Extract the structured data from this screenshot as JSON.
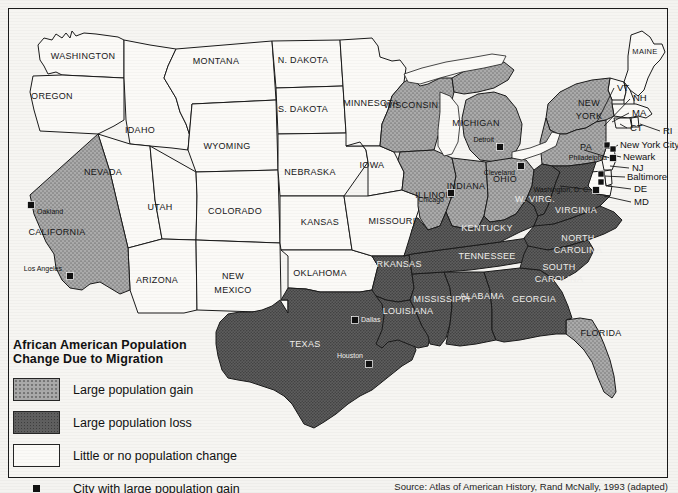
{
  "legend": {
    "title_line1": "African American Population",
    "title_line2": "Change Due to Migration",
    "items": [
      {
        "key": "gain",
        "label": "Large population gain",
        "color": "#a9a9a9"
      },
      {
        "key": "loss",
        "label": "Large population loss",
        "color": "#5f5f5f"
      },
      {
        "key": "none",
        "label": "Little or no population change",
        "color": "#fbfaf7"
      },
      {
        "key": "city",
        "label": "City with large population gain",
        "color": "#111111"
      }
    ]
  },
  "source": "Source: Atlas of American History, Rand McNally, 1993 (adapted)",
  "map": {
    "states": [
      {
        "name": "WASHINGTON",
        "class": "none",
        "lx": 83,
        "ly": 57,
        "size": ""
      },
      {
        "name": "OREGON",
        "class": "none",
        "lx": 52,
        "ly": 97,
        "size": ""
      },
      {
        "name": "IDAHO",
        "class": "none",
        "lx": 140,
        "ly": 131,
        "size": ""
      },
      {
        "name": "MONTANA",
        "class": "none",
        "lx": 216,
        "ly": 62,
        "size": ""
      },
      {
        "name": "WYOMING",
        "class": "none",
        "lx": 227,
        "ly": 147,
        "size": ""
      },
      {
        "name": "NEVADA",
        "class": "none",
        "lx": 103,
        "ly": 173,
        "size": ""
      },
      {
        "name": "UTAH",
        "class": "none",
        "lx": 160,
        "ly": 208,
        "size": ""
      },
      {
        "name": "COLORADO",
        "class": "none",
        "lx": 235,
        "ly": 212,
        "size": ""
      },
      {
        "name": "ARIZONA",
        "class": "none",
        "lx": 157,
        "ly": 281,
        "size": ""
      },
      {
        "name": "NEW",
        "class": "none",
        "lx": 233,
        "ly": 277,
        "size": ""
      },
      {
        "name": "MEXICO",
        "class": "none",
        "lx": 233,
        "ly": 291,
        "size": ""
      },
      {
        "name": "N. DAKOTA",
        "class": "none",
        "lx": 303,
        "ly": 61,
        "size": ""
      },
      {
        "name": "S. DAKOTA",
        "class": "none",
        "lx": 303,
        "ly": 110,
        "size": ""
      },
      {
        "name": "NEBRASKA",
        "class": "none",
        "lx": 310,
        "ly": 173,
        "size": ""
      },
      {
        "name": "KANSAS",
        "class": "none",
        "lx": 320,
        "ly": 223,
        "size": ""
      },
      {
        "name": "OKLAHOMA",
        "class": "none",
        "lx": 320,
        "ly": 274,
        "size": ""
      },
      {
        "name": "IOWA",
        "class": "none",
        "lx": 372,
        "ly": 166,
        "size": ""
      },
      {
        "name": "MAINE",
        "class": "none",
        "lx": 645,
        "ly": 52,
        "size": "sm"
      },
      {
        "name": "CALIFORNIA",
        "class": "gain",
        "lx": 57,
        "ly": 233,
        "size": ""
      },
      {
        "name": "WISCONSIN",
        "class": "gain",
        "lx": 411,
        "ly": 106,
        "size": ""
      },
      {
        "name": "MICHIGAN",
        "class": "gain",
        "lx": 476,
        "ly": 124,
        "size": ""
      },
      {
        "name": "ILLINOIS",
        "class": "gain",
        "lx": 435,
        "ly": 196,
        "size": ""
      },
      {
        "name": "INDIANA",
        "class": "gain",
        "lx": 466,
        "ly": 187,
        "size": ""
      },
      {
        "name": "OHIO",
        "class": "gain",
        "lx": 505,
        "ly": 180,
        "size": ""
      },
      {
        "name": "NEW",
        "class": "gain",
        "lx": 589,
        "ly": 104,
        "size": ""
      },
      {
        "name": "YORK",
        "class": "gain",
        "lx": 589,
        "ly": 117,
        "size": ""
      },
      {
        "name": "PA",
        "class": "gain",
        "lx": 586,
        "ly": 148,
        "size": ""
      },
      {
        "name": "FLORIDA",
        "class": "gain",
        "lx": 601,
        "ly": 334,
        "size": ""
      },
      {
        "name": "MINNESOTA",
        "class": "none",
        "lx": 371,
        "ly": 104,
        "size": ""
      },
      {
        "name": "MISSOURI",
        "class": "none",
        "lx": 392,
        "ly": 222,
        "size": ""
      },
      {
        "name": "W. VIRG.",
        "class": "loss",
        "lx": 535,
        "ly": 200,
        "size": ""
      },
      {
        "name": "VIRGINIA",
        "class": "loss",
        "lx": 576,
        "ly": 211,
        "size": ""
      },
      {
        "name": "KENTUCKY",
        "class": "loss",
        "lx": 487,
        "ly": 229,
        "size": ""
      },
      {
        "name": "TENNESSEE",
        "class": "loss",
        "lx": 487,
        "ly": 257,
        "size": ""
      },
      {
        "name": "NORTH",
        "class": "loss",
        "lx": 578,
        "ly": 239,
        "size": ""
      },
      {
        "name": "CAROLINA",
        "class": "loss",
        "lx": 578,
        "ly": 251,
        "size": ""
      },
      {
        "name": "SOUTH",
        "class": "loss",
        "lx": 559,
        "ly": 268,
        "size": ""
      },
      {
        "name": "CAROLINA",
        "class": "loss",
        "lx": 559,
        "ly": 280,
        "size": ""
      },
      {
        "name": "GEORGIA",
        "class": "loss",
        "lx": 534,
        "ly": 300,
        "size": ""
      },
      {
        "name": "ALABAMA",
        "class": "loss",
        "lx": 482,
        "ly": 297,
        "size": ""
      },
      {
        "name": "MISSISSIPPI",
        "class": "loss",
        "lx": 442,
        "ly": 300,
        "size": ""
      },
      {
        "name": "LOUISIANA",
        "class": "loss",
        "lx": 408,
        "ly": 312,
        "size": ""
      },
      {
        "name": "ARKANSAS",
        "class": "loss",
        "lx": 396,
        "ly": 265,
        "size": ""
      },
      {
        "name": "TEXAS",
        "class": "loss",
        "lx": 305,
        "ly": 345,
        "size": ""
      }
    ],
    "ne_labels": [
      {
        "name": "VT",
        "lx": 617,
        "ly": 88
      },
      {
        "name": "NH",
        "lx": 633,
        "ly": 98
      },
      {
        "name": "MA",
        "lx": 632,
        "ly": 113
      },
      {
        "name": "CT",
        "lx": 630,
        "ly": 128
      },
      {
        "name": "RI",
        "lx": 663,
        "ly": 131
      },
      {
        "name": "New York City",
        "lx": 620,
        "ly": 145
      },
      {
        "name": "Newark",
        "lx": 623,
        "ly": 157
      },
      {
        "name": "NJ",
        "lx": 632,
        "ly": 168
      },
      {
        "name": "Baltimore",
        "lx": 627,
        "ly": 177
      },
      {
        "name": "DE",
        "lx": 634,
        "ly": 189
      },
      {
        "name": "MD",
        "lx": 634,
        "ly": 202
      }
    ],
    "cities": [
      {
        "name": "Oakland",
        "mx": 31,
        "my": 205,
        "tx": 37,
        "ty": 212,
        "dark": false,
        "anchor": "start"
      },
      {
        "name": "Los Angeles",
        "mx": 70,
        "my": 276,
        "tx": 62,
        "ty": 269,
        "dark": false,
        "anchor": "end"
      },
      {
        "name": "Chicago",
        "mx": 451,
        "my": 193,
        "tx": 444,
        "ty": 200,
        "dark": false,
        "anchor": "end"
      },
      {
        "name": "Detroit",
        "mx": 500,
        "my": 147,
        "tx": 494,
        "ty": 140,
        "dark": false,
        "anchor": "end"
      },
      {
        "name": "Cleveland",
        "mx": 521,
        "my": 166,
        "tx": 515,
        "ty": 173,
        "dark": false,
        "anchor": "end"
      },
      {
        "name": "Philadelphia",
        "mx": 613,
        "my": 158,
        "tx": 607,
        "ty": 158,
        "dark": false,
        "anchor": "end"
      },
      {
        "name": "Washington, D. C.",
        "mx": 596,
        "my": 190,
        "tx": 590,
        "ty": 190,
        "dark": false,
        "anchor": "end"
      },
      {
        "name": "Dallas",
        "mx": 355,
        "my": 320,
        "tx": 361,
        "ty": 320,
        "dark": true,
        "anchor": "start"
      },
      {
        "name": "Houston",
        "mx": 369,
        "my": 364,
        "tx": 363,
        "ty": 356,
        "dark": true,
        "anchor": "end"
      }
    ],
    "ne_markers": [
      {
        "mx": 607,
        "my": 145
      },
      {
        "mx": 613,
        "my": 149
      },
      {
        "mx": 601,
        "my": 174
      },
      {
        "mx": 601,
        "my": 182
      }
    ],
    "colors": {
      "gain_fill": "#a9a9a9",
      "gain_dot": "#7a7a7a",
      "loss_fill": "#5f5f5f",
      "loss_dot": "#3d3d3d",
      "none_fill": "#fbfaf7",
      "outline": "#1a1a1a",
      "frame": "#1a1a1a"
    }
  }
}
